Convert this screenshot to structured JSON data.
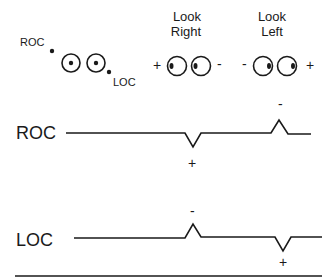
{
  "diagram": {
    "legend": {
      "roc_label": "ROC",
      "loc_label": "LOC"
    },
    "look_right": {
      "line1": "Look",
      "line2": "Right",
      "left_sign": "+",
      "right_sign": "-"
    },
    "look_left": {
      "line1": "Look",
      "line2": "Left",
      "left_sign": "-",
      "right_sign": "+"
    },
    "traces": [
      {
        "label": "ROC",
        "events": [
          {
            "position": "look-right",
            "deflection": "down",
            "sign": "+"
          },
          {
            "position": "look-left",
            "deflection": "up",
            "sign": "-"
          }
        ]
      },
      {
        "label": "LOC",
        "events": [
          {
            "position": "look-right",
            "deflection": "up",
            "sign": "-"
          },
          {
            "position": "look-left",
            "deflection": "down",
            "sign": "+"
          }
        ]
      }
    ],
    "colors": {
      "ink": "#1a1a1a",
      "background": "#ffffff"
    }
  }
}
